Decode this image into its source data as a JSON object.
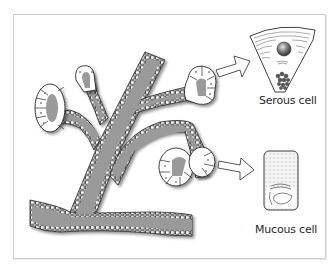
{
  "figure": {
    "colors": {
      "duct_lumen": "#9a9a9a",
      "cell_fill": "#ffffff",
      "outline": "#2b2b2b",
      "frame_border": "#cfcfcf",
      "nucleus": "#555555"
    },
    "labels": {
      "serous": "Serous cell",
      "mucous": "Mucous cell"
    },
    "parts": [
      {
        "id": "main-duct",
        "name": "Main excretory duct"
      },
      {
        "id": "branch-ducts",
        "name": "Intralobular branch ducts"
      },
      {
        "id": "acini-left",
        "name": "Secretory acini (left branches)"
      },
      {
        "id": "acinus-upper-right",
        "name": "Secretory acinus (upper right)"
      },
      {
        "id": "acinus-lower-right",
        "name": "Secretory acinus (lower right)"
      },
      {
        "id": "arrow-to-serous",
        "name": "Arrow to serous cell"
      },
      {
        "id": "arrow-to-mucous",
        "name": "Arrow to mucous cell"
      },
      {
        "id": "serous-cell",
        "name": "Serous cell (enlarged)"
      },
      {
        "id": "mucous-cell",
        "name": "Mucous cell (enlarged)"
      }
    ]
  }
}
